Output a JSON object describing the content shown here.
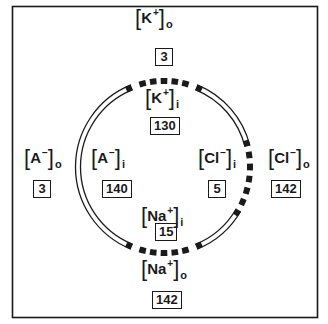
{
  "diagram": {
    "type": "cell-membrane-ion-concentrations",
    "colors": {
      "ink": "#1a1a1a",
      "background": "#ffffff"
    },
    "ions": [
      {
        "id": "k-out",
        "symbol": "K",
        "charge": "+",
        "compartment": "o",
        "value": "3"
      },
      {
        "id": "k-in",
        "symbol": "K",
        "charge": "+",
        "compartment": "i",
        "value": "130"
      },
      {
        "id": "a-out",
        "symbol": "A",
        "charge": "−",
        "compartment": "o",
        "value": "3"
      },
      {
        "id": "a-in",
        "symbol": "A",
        "charge": "−",
        "compartment": "i",
        "value": "140"
      },
      {
        "id": "cl-in",
        "symbol": "Cl",
        "charge": "−",
        "compartment": "i",
        "value": "5"
      },
      {
        "id": "cl-out",
        "symbol": "Cl",
        "charge": "−",
        "compartment": "o",
        "value": "142"
      },
      {
        "id": "na-in",
        "symbol": "Na",
        "charge": "+",
        "compartment": "i",
        "value": "15"
      },
      {
        "id": "na-out",
        "symbol": "Na",
        "charge": "+",
        "compartment": "o",
        "value": "142"
      }
    ],
    "membrane_pores": [
      "K+ channel (top)",
      "Cl− channel (right)",
      "Na+ channel (bottom)"
    ]
  }
}
